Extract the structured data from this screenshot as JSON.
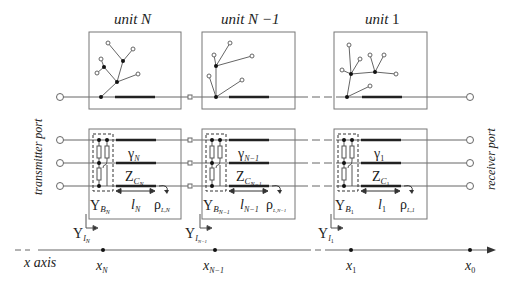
{
  "units": [
    {
      "title_prefix": "unit",
      "title_var": "N",
      "gamma_sub": "N",
      "zc_sub": "N",
      "l_sub": "N",
      "yb_sub": "N",
      "rho_sub": "L,N",
      "yi_sub": "N",
      "x_sub": "N"
    },
    {
      "title_prefix": "unit",
      "title_var": "N −1",
      "gamma_sub": "N−1",
      "zc_sub": "N−1",
      "l_sub": "N−1",
      "yb_sub": "N−1",
      "rho_sub": "L,N−1",
      "yi_sub": "N−1",
      "x_sub": "N−1"
    },
    {
      "title_prefix": "unit",
      "title_var": "1",
      "gamma_sub": "1",
      "zc_sub": "1",
      "l_sub": "1",
      "yb_sub": "1",
      "rho_sub": "L,1",
      "yi_sub": "1",
      "x_sub": "1"
    }
  ],
  "labels": {
    "transmitter_port": "transmitter port",
    "receiver_port": "receiver port",
    "x_axis": "x axis",
    "x0_sub": "0",
    "gamma": "γ",
    "zc": "Z",
    "zc_c": "C",
    "l": "l",
    "yb": "Y",
    "yb_b": "B",
    "rho": "ρ",
    "yi": "Y",
    "yi_i": "I",
    "x": "x"
  },
  "colors": {
    "line": "#555555",
    "thick": "#222222",
    "box": "#666666",
    "text": "#222222"
  }
}
